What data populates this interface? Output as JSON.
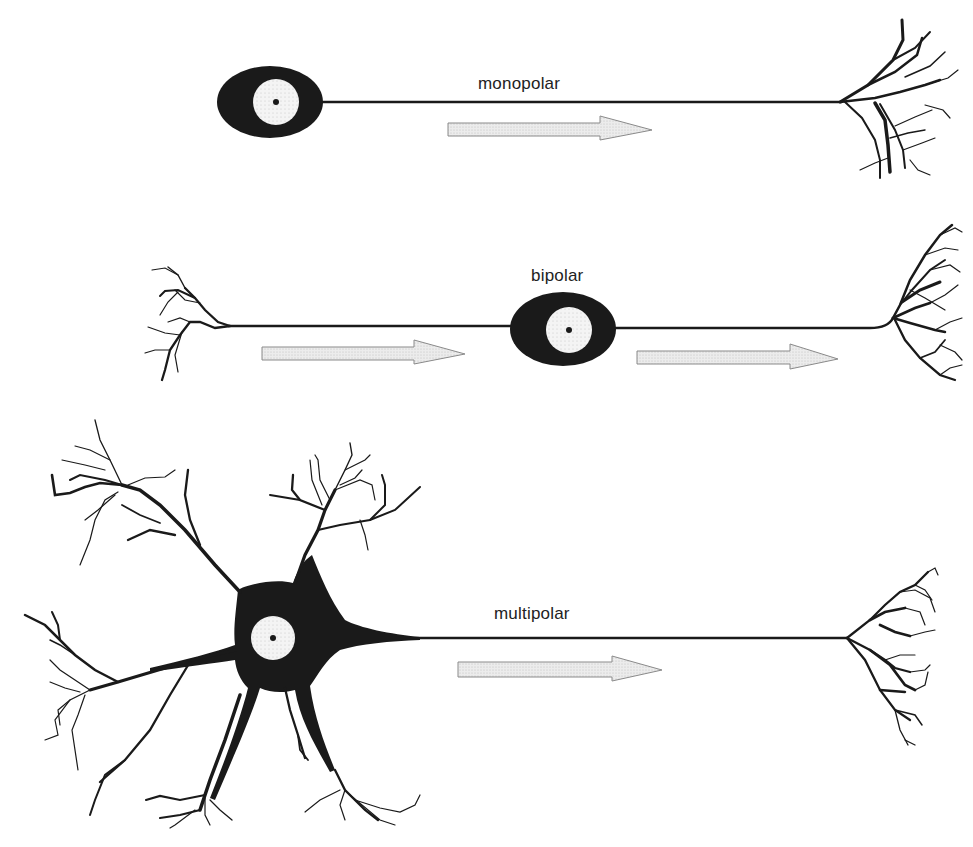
{
  "diagram": {
    "colors": {
      "ink": "#1a1a1a",
      "nucleus_fill": "#f2f2f2",
      "arrow_fill": "#e6e6e6",
      "arrow_stroke": "#8a8a8a",
      "background": "#ffffff"
    },
    "neurons": [
      {
        "id": "monopolar",
        "label": "monopolar",
        "parts": [
          "cell-body",
          "nucleus",
          "axon",
          "axon-terminal"
        ],
        "arrow_direction": "right"
      },
      {
        "id": "bipolar",
        "label": "bipolar",
        "parts": [
          "dendrites",
          "axon-left",
          "cell-body",
          "nucleus",
          "axon-right",
          "axon-terminal"
        ],
        "arrow_direction": "right",
        "arrow_count": 2
      },
      {
        "id": "multipolar",
        "label": "multipolar",
        "parts": [
          "dendrites",
          "cell-body",
          "nucleus",
          "axon",
          "axon-terminal"
        ],
        "arrow_direction": "right"
      }
    ]
  }
}
